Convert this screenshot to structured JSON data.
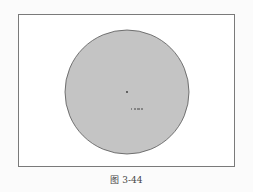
{
  "figure": {
    "caption": "图 3-44",
    "circle": {
      "cx": 127,
      "cy": 92,
      "r": 62,
      "fill": "#c4c4c4",
      "stroke": "#555555"
    },
    "center_mark": {
      "x": 127,
      "y": 92
    },
    "dimension_label": "R ..."
  },
  "colors": {
    "background": "#fbfbfb",
    "frame_border": "#7a7a7a",
    "circle_fill": "#c4c4c4",
    "circle_stroke": "#555555"
  }
}
